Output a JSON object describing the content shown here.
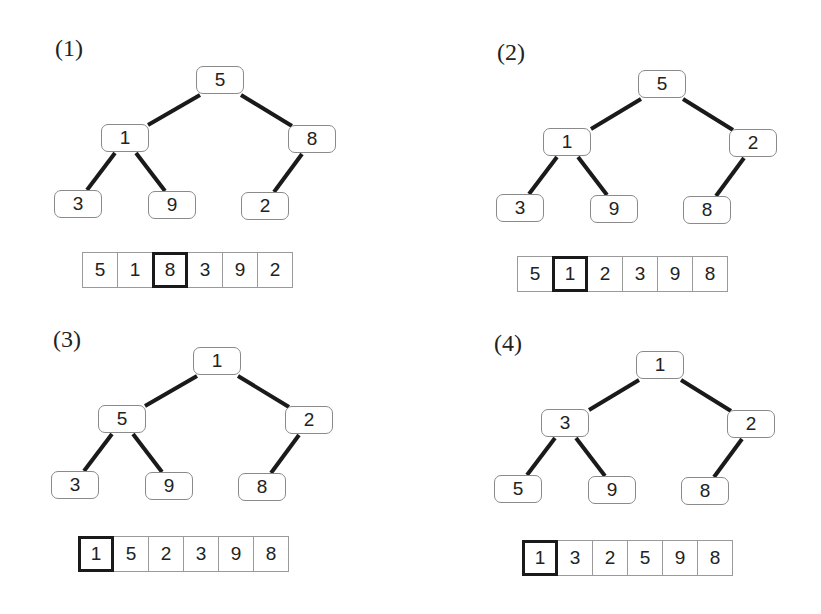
{
  "panels": [
    {
      "label": "(1)",
      "tree": {
        "root": "5",
        "l": "1",
        "r": "8",
        "ll": "3",
        "lr": "9",
        "rl": "2"
      },
      "array": [
        "5",
        "1",
        "8",
        "3",
        "9",
        "2"
      ],
      "highlight_index": 2
    },
    {
      "label": "(2)",
      "tree": {
        "root": "5",
        "l": "1",
        "r": "2",
        "ll": "3",
        "lr": "9",
        "rl": "8"
      },
      "array": [
        "5",
        "1",
        "2",
        "3",
        "9",
        "8"
      ],
      "highlight_index": 1
    },
    {
      "label": "(3)",
      "tree": {
        "root": "1",
        "l": "5",
        "r": "2",
        "ll": "3",
        "lr": "9",
        "rl": "8"
      },
      "array": [
        "1",
        "5",
        "2",
        "3",
        "9",
        "8"
      ],
      "highlight_index": 0
    },
    {
      "label": "(4)",
      "tree": {
        "root": "1",
        "l": "3",
        "r": "2",
        "ll": "5",
        "lr": "9",
        "rl": "8"
      },
      "array": [
        "1",
        "3",
        "2",
        "5",
        "9",
        "8"
      ],
      "highlight_index": 0
    }
  ],
  "colors": {
    "edge": "#1a1a1a",
    "node_border": "#8a8a8a",
    "highlight_border": "#1a1a1a"
  }
}
